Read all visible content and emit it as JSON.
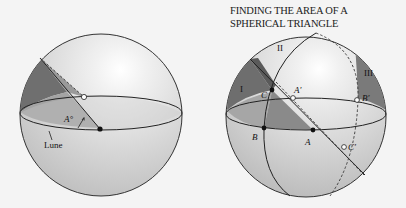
{
  "title": {
    "line1": "FINDING THE AREA OF A",
    "line2": "SPHERICAL TRIANGLE"
  },
  "left_figure": {
    "angle_label": "A°",
    "lune_label": "Lune"
  },
  "right_figure": {
    "region_labels": [
      "I",
      "II",
      "III"
    ],
    "point_labels": {
      "A": "A",
      "B": "B",
      "C": "C",
      "A_prime": "A′",
      "B_prime": "B′",
      "C_prime": "C′"
    }
  },
  "colors": {
    "sphere_fill": "#d9d9d9",
    "shade_dark": "#7a7a7a",
    "shade_mid": "#a9a9a9",
    "line": "#222222",
    "background": "#f4f4f4"
  }
}
